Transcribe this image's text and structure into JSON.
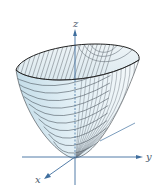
{
  "figure": {
    "axes": {
      "x_label": "x",
      "y_label": "y",
      "z_label": "z"
    },
    "colors": {
      "surface_fill": "#d6e9f2",
      "surface_inner": "#e8f1f5",
      "axis": "#3f6e9e",
      "rim": "#2b2b2b",
      "contour": "#5b6570",
      "label": "#4a5a6e"
    }
  }
}
